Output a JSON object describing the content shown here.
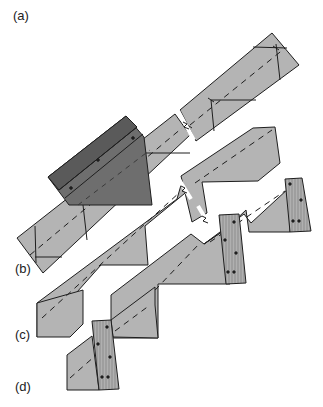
{
  "diagram": {
    "type": "technical-illustration",
    "labels": {
      "a": "(a)",
      "b": "(b)",
      "c": "(c)",
      "d": "(d)"
    },
    "stages": [
      {
        "id": "a",
        "label": "(a)",
        "description": "Board with layout lines, dashed centerline, and dark framing square placed on it"
      },
      {
        "id": "b",
        "label": "(b)",
        "description": "Notched stringer with sawtooth cut-outs"
      },
      {
        "id": "c",
        "label": "(c)",
        "description": "Stringer with wooden tread/riser blocks attached"
      },
      {
        "id": "d",
        "label": "(d)",
        "description": "Final lower segment with block attached"
      }
    ],
    "colors": {
      "board_fill": "#b4b4b4",
      "square_fill": "#6e6e6e",
      "outline": "#1e1e1e",
      "block_fill": "#b0b0b0"
    }
  }
}
